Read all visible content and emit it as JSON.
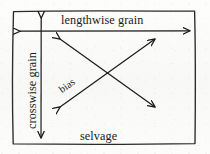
{
  "figure": {
    "frame": {
      "name": "fabric-rectangle",
      "x": 12,
      "y": 10,
      "width": 184,
      "height": 135
    },
    "ink_color": "#1a1a18",
    "background_color": "#fbfbf9",
    "labels": {
      "lengthwise": "lengthwise grain",
      "crosswise": "crosswise grain",
      "bias": "bias",
      "selvage": "selvage"
    },
    "arrows": [
      {
        "name": "lengthwise-grain-arrow",
        "label": "lengthwise grain",
        "orientation": "horizontal",
        "double_headed": true,
        "x1": 19,
        "y1": 31,
        "x2": 191,
        "y2": 31
      },
      {
        "name": "crosswise-grain-arrow",
        "label": "crosswise grain",
        "orientation": "vertical",
        "double_headed": true,
        "x1": 41,
        "y1": 17,
        "x2": 41,
        "y2": 139
      },
      {
        "name": "bias-arrow-nw-se",
        "label": "bias",
        "orientation": "diagonal-descending",
        "double_headed": true,
        "x1": 59,
        "y1": 38,
        "x2": 156,
        "y2": 108
      },
      {
        "name": "bias-arrow-sw-ne",
        "label": "bias",
        "orientation": "diagonal-ascending",
        "double_headed": true,
        "x1": 59,
        "y1": 108,
        "x2": 156,
        "y2": 38
      }
    ]
  }
}
